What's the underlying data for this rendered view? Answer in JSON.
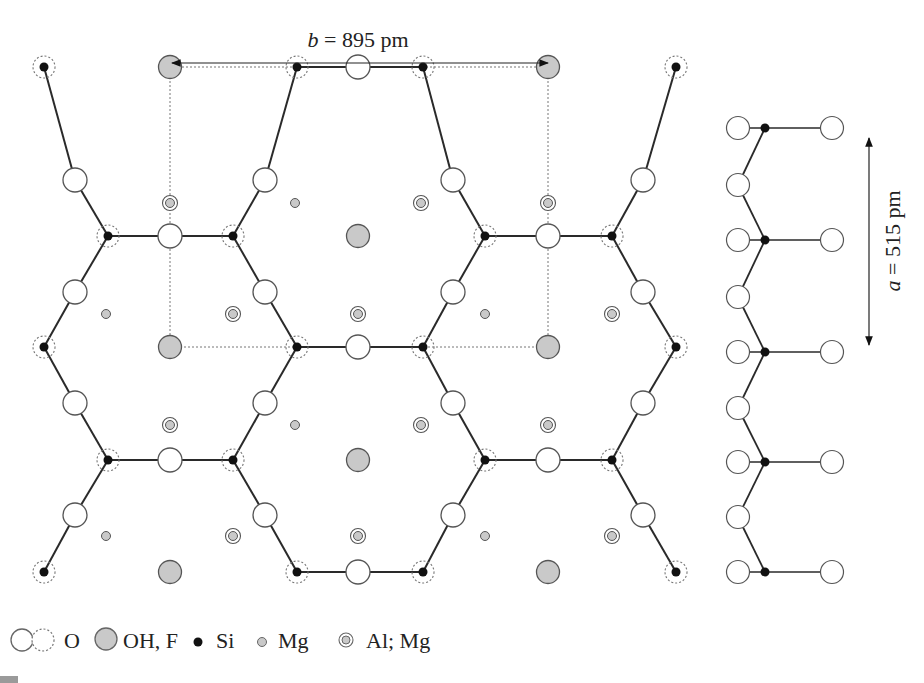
{
  "title_b": {
    "var": "b",
    "text": " = 895 pm",
    "x": 358,
    "y": 47
  },
  "arrow_b": {
    "x1": 172,
    "x2": 548,
    "y": 63
  },
  "title_a": {
    "var": "a",
    "text": " = 515 pm",
    "x": 900,
    "y": 241
  },
  "arrow_a": {
    "x": 869,
    "y1": 138,
    "y2": 345
  },
  "colors": {
    "bond": "#2a2a2a",
    "si": "#111111",
    "oh_fill": "#c9c9c9",
    "mg_fill": "#c9c9c9",
    "outline": "#555555",
    "dotted": "#777777"
  },
  "unit_cell": {
    "x1": 170,
    "y1": 67,
    "x2": 548,
    "y2": 347
  },
  "si": [
    [
      44,
      67
    ],
    [
      297,
      67
    ],
    [
      423,
      67
    ],
    [
      676,
      67
    ],
    [
      108,
      236
    ],
    [
      233,
      236
    ],
    [
      485,
      236
    ],
    [
      612,
      236
    ],
    [
      44,
      347
    ],
    [
      297,
      347
    ],
    [
      423,
      347
    ],
    [
      676,
      347
    ],
    [
      108,
      460
    ],
    [
      233,
      460
    ],
    [
      485,
      460
    ],
    [
      612,
      460
    ],
    [
      44,
      572
    ],
    [
      297,
      572
    ],
    [
      423,
      572
    ],
    [
      676,
      572
    ]
  ],
  "o_bridge": [
    [
      75,
      180
    ],
    [
      265,
      180
    ],
    [
      453,
      180
    ],
    [
      643,
      180
    ],
    [
      75,
      292
    ],
    [
      265,
      292
    ],
    [
      453,
      292
    ],
    [
      643,
      292
    ],
    [
      75,
      403
    ],
    [
      265,
      403
    ],
    [
      453,
      403
    ],
    [
      643,
      403
    ],
    [
      75,
      515
    ],
    [
      265,
      515
    ],
    [
      453,
      515
    ],
    [
      643,
      515
    ],
    [
      358,
      67
    ],
    [
      170,
      236
    ],
    [
      548,
      236
    ],
    [
      358,
      347
    ],
    [
      170,
      460
    ],
    [
      548,
      460
    ],
    [
      358,
      572
    ]
  ],
  "oh": [
    [
      170,
      67
    ],
    [
      548,
      67
    ],
    [
      358,
      236
    ],
    [
      170,
      347
    ],
    [
      548,
      347
    ],
    [
      358,
      460
    ],
    [
      170,
      572
    ],
    [
      548,
      572
    ]
  ],
  "mg": [
    [
      295,
      203
    ],
    [
      106,
      314
    ],
    [
      485,
      314
    ],
    [
      295,
      425
    ],
    [
      106,
      536
    ],
    [
      485,
      536
    ]
  ],
  "almg": [
    [
      170,
      203
    ],
    [
      421,
      203
    ],
    [
      548,
      203
    ],
    [
      233,
      314
    ],
    [
      358,
      314
    ],
    [
      612,
      314
    ],
    [
      170,
      425
    ],
    [
      421,
      425
    ],
    [
      548,
      425
    ],
    [
      233,
      536
    ],
    [
      358,
      536
    ],
    [
      612,
      536
    ]
  ],
  "bonds": [
    [
      44,
      67,
      75,
      180
    ],
    [
      75,
      180,
      108,
      236
    ],
    [
      108,
      236,
      170,
      236
    ],
    [
      170,
      236,
      233,
      236
    ],
    [
      233,
      236,
      265,
      180
    ],
    [
      265,
      180,
      297,
      67
    ],
    [
      297,
      67,
      358,
      67
    ],
    [
      358,
      67,
      423,
      67
    ],
    [
      423,
      67,
      453,
      180
    ],
    [
      453,
      180,
      485,
      236
    ],
    [
      485,
      236,
      548,
      236
    ],
    [
      548,
      236,
      612,
      236
    ],
    [
      612,
      236,
      643,
      180
    ],
    [
      643,
      180,
      676,
      67
    ],
    [
      108,
      236,
      75,
      292
    ],
    [
      75,
      292,
      44,
      347
    ],
    [
      233,
      236,
      265,
      292
    ],
    [
      265,
      292,
      297,
      347
    ],
    [
      485,
      236,
      453,
      292
    ],
    [
      453,
      292,
      423,
      347
    ],
    [
      612,
      236,
      643,
      292
    ],
    [
      643,
      292,
      676,
      347
    ],
    [
      297,
      347,
      358,
      347
    ],
    [
      358,
      347,
      423,
      347
    ],
    [
      44,
      347,
      75,
      403
    ],
    [
      75,
      403,
      108,
      460
    ],
    [
      297,
      347,
      265,
      403
    ],
    [
      265,
      403,
      233,
      460
    ],
    [
      423,
      347,
      453,
      403
    ],
    [
      453,
      403,
      485,
      460
    ],
    [
      676,
      347,
      643,
      403
    ],
    [
      643,
      403,
      612,
      460
    ],
    [
      108,
      460,
      170,
      460
    ],
    [
      170,
      460,
      233,
      460
    ],
    [
      485,
      460,
      548,
      460
    ],
    [
      548,
      460,
      612,
      460
    ],
    [
      108,
      460,
      75,
      515
    ],
    [
      75,
      515,
      44,
      572
    ],
    [
      233,
      460,
      265,
      515
    ],
    [
      265,
      515,
      297,
      572
    ],
    [
      485,
      460,
      453,
      515
    ],
    [
      453,
      515,
      423,
      572
    ],
    [
      612,
      460,
      643,
      515
    ],
    [
      643,
      515,
      676,
      572
    ],
    [
      297,
      572,
      358,
      572
    ],
    [
      358,
      572,
      423,
      572
    ]
  ],
  "side_chain": {
    "si": [
      [
        765,
        128
      ],
      [
        765,
        240
      ],
      [
        765,
        352
      ],
      [
        765,
        462
      ],
      [
        765,
        572
      ]
    ],
    "o_left": [
      [
        738,
        128
      ],
      [
        738,
        185
      ],
      [
        738,
        240
      ],
      [
        738,
        297
      ],
      [
        738,
        352
      ],
      [
        738,
        408
      ],
      [
        738,
        462
      ],
      [
        738,
        517
      ],
      [
        738,
        572
      ]
    ],
    "o_right": [
      [
        832,
        128
      ],
      [
        832,
        240
      ],
      [
        832,
        352
      ],
      [
        832,
        462
      ],
      [
        832,
        572
      ]
    ]
  },
  "legend": {
    "y": 640,
    "items": [
      {
        "label": "O",
        "x": 84
      },
      {
        "label": "OH, F",
        "x": 195
      },
      {
        "label": "Si",
        "x": 293
      },
      {
        "label": "Mg",
        "x": 384
      },
      {
        "label": "Al; Mg",
        "x": 496
      }
    ]
  }
}
